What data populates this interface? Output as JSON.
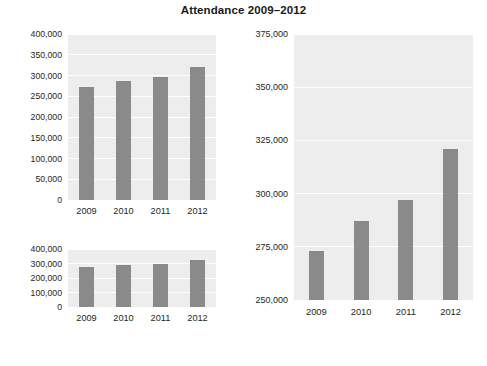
{
  "title": "Attendance 2009–2012",
  "colors": {
    "bar": "#8a8a8a",
    "panel": "#ededed",
    "gridline": "#ffffff",
    "background": "#ffffff",
    "text": "#231f20"
  },
  "chart_data": [
    {
      "type": "bar",
      "id": "top-left",
      "title": "Attendance 2009–2012",
      "xlabel": "",
      "ylabel": "",
      "categories": [
        "2009",
        "2010",
        "2011",
        "2012"
      ],
      "values": [
        273000,
        287000,
        297000,
        321000
      ],
      "ylim": [
        0,
        400000
      ],
      "yticks": [
        0,
        50000,
        100000,
        150000,
        200000,
        250000,
        300000,
        350000,
        400000
      ],
      "ytick_labels": [
        "0",
        "50,000",
        "100,000",
        "150,000",
        "200,000",
        "250,000",
        "300,000",
        "350,000",
        "400,000"
      ],
      "grid": true,
      "legend": "none"
    },
    {
      "type": "bar",
      "id": "bottom-left",
      "title": "",
      "xlabel": "",
      "ylabel": "",
      "categories": [
        "2009",
        "2010",
        "2011",
        "2012"
      ],
      "values": [
        273000,
        287000,
        297000,
        321000
      ],
      "ylim": [
        0,
        400000
      ],
      "yticks": [
        0,
        100000,
        200000,
        300000,
        400000
      ],
      "ytick_labels": [
        "0",
        "100,000",
        "200,000",
        "300,000",
        "400,000"
      ],
      "grid": true,
      "legend": "none"
    },
    {
      "type": "bar",
      "id": "right",
      "title": "",
      "xlabel": "",
      "ylabel": "",
      "categories": [
        "2009",
        "2010",
        "2011",
        "2012"
      ],
      "values": [
        273000,
        287000,
        297000,
        321000
      ],
      "ylim": [
        250000,
        375000
      ],
      "yticks": [
        250000,
        275000,
        300000,
        325000,
        350000,
        375000
      ],
      "ytick_labels": [
        "250,000",
        "275,000",
        "300,000",
        "325,000",
        "350,000",
        "375,000"
      ],
      "grid": true,
      "legend": "none"
    }
  ]
}
